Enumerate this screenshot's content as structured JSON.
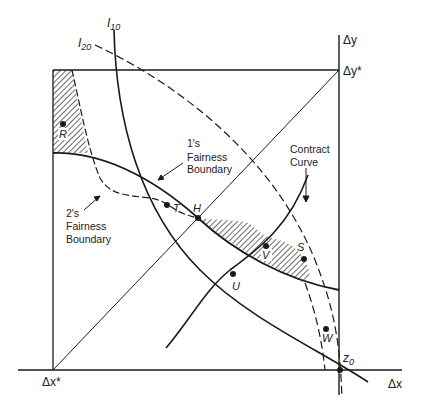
{
  "figure": {
    "type": "Edgeworth-style fairness diagram",
    "axes": {
      "x_axis_label": "Δx",
      "y_axis_label": "Δy",
      "origin_label": "Δx*",
      "top_right_label": "Δy*",
      "corner_point_label": "z",
      "corner_point_subscript": "0"
    },
    "indifference_curves": [
      {
        "name": "I",
        "subscript": "10",
        "style": "solid"
      },
      {
        "name": "I",
        "subscript": "20",
        "style": "dashed"
      }
    ],
    "boundaries": {
      "one": {
        "line1": "1's",
        "line2": "Fairness",
        "line3": "Boundary"
      },
      "two": {
        "line1": "2's",
        "line2": "Fairness",
        "line3": "Boundary"
      }
    },
    "contract_curve": {
      "line1": "Contract",
      "line2": "Curve"
    },
    "points": {
      "R": "R",
      "T": "T",
      "H": "H",
      "V": "V",
      "U": "U",
      "S": "S",
      "W": "W"
    },
    "colors": {
      "ink": "#1a1a1a",
      "background": "#ffffff"
    }
  }
}
